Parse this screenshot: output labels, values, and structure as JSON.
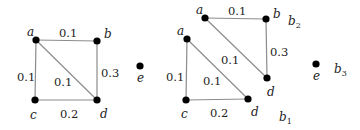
{
  "figure": {
    "left_graph": {
      "vertices": [
        {
          "id": "a",
          "label": "a",
          "x": 36,
          "y": 40
        },
        {
          "id": "b",
          "label": "b",
          "x": 97,
          "y": 41
        },
        {
          "id": "c",
          "label": "c",
          "x": 35,
          "y": 100
        },
        {
          "id": "d",
          "label": "d",
          "x": 97,
          "y": 100
        },
        {
          "id": "e",
          "label": "e",
          "x": 140,
          "y": 66
        }
      ],
      "edges": [
        {
          "from": "a",
          "to": "b",
          "weight": "0.1"
        },
        {
          "from": "a",
          "to": "c",
          "weight": "0.1"
        },
        {
          "from": "a",
          "to": "d",
          "weight": "0.1"
        },
        {
          "from": "b",
          "to": "d",
          "weight": "0.3"
        },
        {
          "from": "c",
          "to": "d",
          "weight": "0.2"
        }
      ]
    },
    "right_graph": {
      "blocks": [
        {
          "name": "b",
          "sub": "1"
        },
        {
          "name": "b",
          "sub": "2"
        },
        {
          "name": "b",
          "sub": "3"
        }
      ],
      "vertices": [
        {
          "id": "a1",
          "label": "a"
        },
        {
          "id": "c1",
          "label": "c"
        },
        {
          "id": "d1",
          "label": "d"
        },
        {
          "id": "a2",
          "label": "a"
        },
        {
          "id": "b2",
          "label": "b"
        },
        {
          "id": "d2",
          "label": "d"
        },
        {
          "id": "e3",
          "label": "e"
        }
      ],
      "edges": [
        {
          "from": "a1",
          "to": "c1",
          "weight": "0.1"
        },
        {
          "from": "a1",
          "to": "d1",
          "weight": "0.1"
        },
        {
          "from": "c1",
          "to": "d1",
          "weight": "0.2"
        },
        {
          "from": "a2",
          "to": "b2",
          "weight": "0.1"
        },
        {
          "from": "a2",
          "to": "d2",
          "weight": "0.1"
        },
        {
          "from": "b2",
          "to": "d2",
          "weight": "0.3"
        }
      ]
    }
  }
}
